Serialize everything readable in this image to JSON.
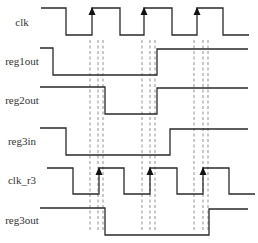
{
  "diagram": {
    "type": "timing-diagram",
    "signals": [
      {
        "name": "clk",
        "label_y": 23
      },
      {
        "name": "reg1out",
        "label_y": 62
      },
      {
        "name": "reg2out",
        "label_y": 101
      },
      {
        "name": "reg3in",
        "label_y": 142
      },
      {
        "name": "clk_r3",
        "label_y": 181
      },
      {
        "name": "reg3out",
        "label_y": 221
      }
    ],
    "colors": {
      "waveform": "#2a2a2a",
      "dashed_guides": "#777777",
      "arrow": "#111111",
      "background": "#ffffff"
    }
  }
}
